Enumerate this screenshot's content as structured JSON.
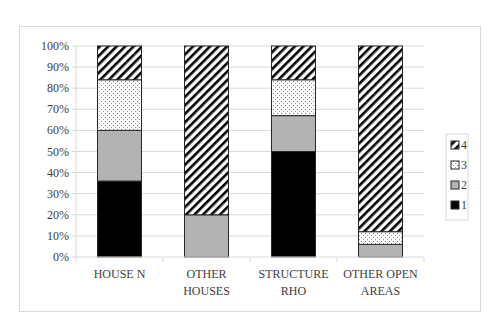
{
  "chart_data": {
    "type": "bar",
    "stacked": true,
    "percent_stacked": true,
    "title": "",
    "xlabel": "",
    "ylabel": "",
    "ylim": [
      0,
      100
    ],
    "y_ticks": [
      "0%",
      "10%",
      "20%",
      "30%",
      "40%",
      "50%",
      "60%",
      "70%",
      "80%",
      "90%",
      "100%"
    ],
    "grid": true,
    "legend_position": "right",
    "categories": [
      "HOUSE N",
      "OTHER HOUSES",
      "STRUCTURE RHO",
      "OTHER OPEN AREAS"
    ],
    "category_lines": [
      [
        "HOUSE N"
      ],
      [
        "OTHER",
        "HOUSES"
      ],
      [
        "STRUCTURE",
        "RHO"
      ],
      [
        "OTHER OPEN",
        "AREAS"
      ]
    ],
    "series": [
      {
        "name": "1",
        "pattern": "solid-black",
        "values": [
          36,
          0,
          50,
          0
        ]
      },
      {
        "name": "2",
        "pattern": "solid-gray",
        "values": [
          24,
          20,
          17,
          6
        ]
      },
      {
        "name": "3",
        "pattern": "dotted",
        "values": [
          24,
          0,
          17,
          6
        ]
      },
      {
        "name": "4",
        "pattern": "diagonal-hatch",
        "values": [
          16,
          80,
          16,
          88
        ]
      }
    ],
    "legend": [
      "4",
      "3",
      "2",
      "1"
    ]
  },
  "colors": {
    "series_1": "#000000",
    "series_2": "#b3b3b3",
    "series_3_bg": "#ffffff",
    "series_3_dot": "#7f7f7f",
    "series_4_bg": "#ffffff",
    "series_4_line": "#000000",
    "grid": "#d9d9d9",
    "frame": "#d9d9d9"
  }
}
